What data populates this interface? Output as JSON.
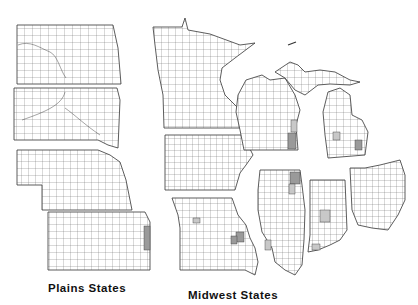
{
  "figure": {
    "groups": [
      {
        "label": "Plains States",
        "states": [
          "North Dakota",
          "South Dakota",
          "Nebraska",
          "Kansas"
        ]
      },
      {
        "label": "Midwest States",
        "states": [
          "Minnesota",
          "Wisconsin",
          "Michigan",
          "Iowa",
          "Missouri",
          "Illinois",
          "Indiana",
          "Ohio"
        ]
      }
    ],
    "style": {
      "outline_color": "#333333",
      "highlight_dark": "#9a9a9a",
      "highlight_light": "#c8c8c8",
      "background": "#ffffff"
    }
  }
}
